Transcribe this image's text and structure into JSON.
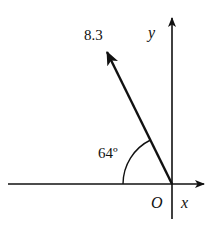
{
  "diagram": {
    "type": "vector-on-axes",
    "vector": {
      "magnitude_label": "8.3",
      "angle_label": "64º",
      "angle_degrees": 64,
      "angle_reference": "negative x-axis"
    },
    "axes": {
      "x_label": "x",
      "y_label": "y",
      "origin_label": "O"
    },
    "colors": {
      "stroke": "#111111",
      "background": "#ffffff"
    }
  }
}
